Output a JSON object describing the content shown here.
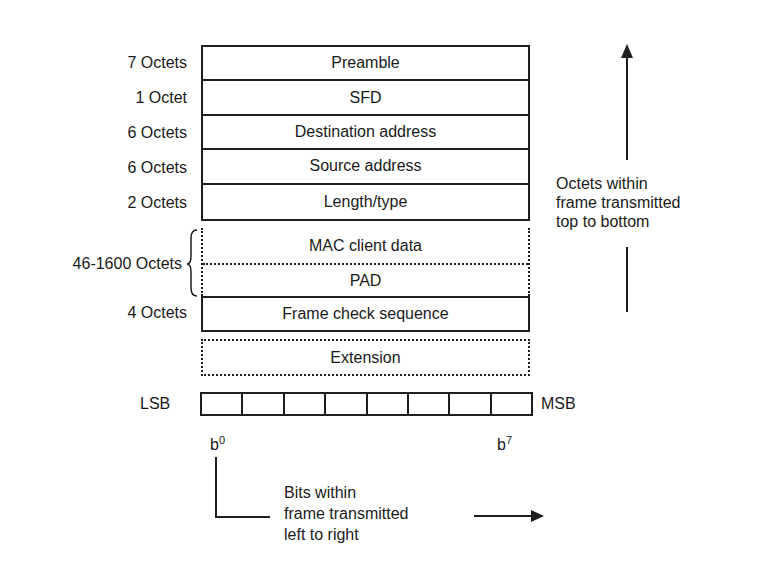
{
  "frame_fields": [
    {
      "size": "7 Octets",
      "name": "Preamble",
      "style": "solid"
    },
    {
      "size": "1 Octet",
      "name": "SFD",
      "style": "solid"
    },
    {
      "size": "6 Octets",
      "name": "Destination address",
      "style": "solid"
    },
    {
      "size": "6 Octets",
      "name": "Source address",
      "style": "solid"
    },
    {
      "size": "2 Octets",
      "name": "Length/type",
      "style": "solid"
    }
  ],
  "variable_group": {
    "size": "46-1600 Octets",
    "fields": [
      "MAC client data",
      "PAD"
    ],
    "style": "dotted"
  },
  "fcs": {
    "size": "4 Octets",
    "name": "Frame check sequence",
    "style": "solid"
  },
  "extension": {
    "name": "Extension",
    "style": "dotted"
  },
  "bit_order": {
    "left_label": "LSB",
    "right_label": "MSB",
    "bit_count": 8,
    "first_bit": "b",
    "first_bit_sup": "0",
    "last_bit": "b",
    "last_bit_sup": "7"
  },
  "octet_note": {
    "lines": [
      "Octets within",
      "frame transmitted",
      "top to bottom"
    ]
  },
  "bit_note": {
    "lines": [
      "Bits within",
      "frame transmitted",
      "left to right"
    ]
  }
}
